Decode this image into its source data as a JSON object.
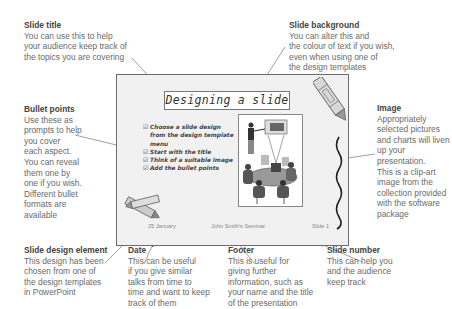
{
  "annotations": {
    "slide_title": {
      "heading": "Slide title",
      "body": "You can use this to help\nyour audience keep track of\nthe topics you are covering"
    },
    "slide_background": {
      "heading": "Slide background",
      "body": "You can alter this and\nthe colour of text if you wish,\neven when using one of\nthe design templates"
    },
    "bullet_points": {
      "heading": "Bullet points",
      "body": "Use these as\nprompts to help\nyou cover\neach aspect.\nYou can reveal\nthem one by\none if you wish.\nDifferent bullet\nformats are\navailable"
    },
    "image": {
      "heading": "Image",
      "body": "Appropriately\nselected pictures\nand charts will liven\nup your presentation.\nThis is a clip-art\nimage from the\ncollection provided\nwith the software\npackage"
    },
    "slide_design_element": {
      "heading": "Slide design element",
      "body": "This design has been\nchosen from one of\nthe design templates\nin PowerPoint"
    },
    "date": {
      "heading": "Date",
      "body": "This can be useful\nif you give similar\ntalks from time to\ntime and want to keep\ntrack of them"
    },
    "footer": {
      "heading": "Footer",
      "body": "This is useful for\ngiving further\ninformation, such as\nyour name and the title\nof the presentation"
    },
    "slide_number": {
      "heading": "Slide number",
      "body": "This can help you\nand the audience\nkeep track"
    }
  },
  "slide": {
    "title": "Designing a slide",
    "bullets": [
      "Choose a slide design from the design template menu",
      "Start with the title",
      "Think of a suitable image",
      "Add the bullet points"
    ],
    "bullet_glyph": "☑",
    "date": "25 January",
    "footer": "John Smith's Seminar",
    "slide_number": "Slide 1"
  }
}
